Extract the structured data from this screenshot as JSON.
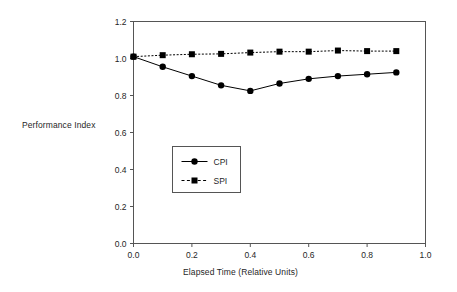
{
  "chart_data": {
    "type": "line",
    "title": "",
    "subtitle": "",
    "xlabel": "Elapsed Time (Relative Units)",
    "ylabel": "Performance Index",
    "xlim": [
      0.0,
      1.0
    ],
    "ylim": [
      0.0,
      1.2
    ],
    "xticks": [
      "0.0",
      "0.2",
      "0.4",
      "0.6",
      "0.8",
      "1.0"
    ],
    "xtick_values": [
      0.0,
      0.2,
      0.4,
      0.6,
      0.8,
      1.0
    ],
    "yticks": [
      "0.0",
      "0.2",
      "0.4",
      "0.6",
      "0.8",
      "1.0",
      "1.2"
    ],
    "ytick_values": [
      0.0,
      0.2,
      0.4,
      0.6,
      0.8,
      1.0,
      1.2
    ],
    "grid": false,
    "legend_position": "center-left-inside",
    "x": [
      0.0,
      0.1,
      0.2,
      0.3,
      0.4,
      0.5,
      0.6,
      0.7,
      0.8,
      0.9
    ],
    "series": [
      {
        "name": "CPI",
        "marker": "circle",
        "linestyle": "solid",
        "color": "#000000",
        "values": [
          1.01,
          0.955,
          0.905,
          0.855,
          0.825,
          0.865,
          0.89,
          0.905,
          0.915,
          0.925
        ]
      },
      {
        "name": "SPI",
        "marker": "square",
        "linestyle": "dashed",
        "color": "#000000",
        "values": [
          1.01,
          1.018,
          1.023,
          1.025,
          1.032,
          1.037,
          1.037,
          1.043,
          1.04,
          1.04
        ]
      }
    ]
  },
  "legend": {
    "entries": [
      {
        "label": "CPI"
      },
      {
        "label": "SPI"
      }
    ]
  },
  "colors": {
    "ink": "#000000",
    "axis": "#555555",
    "background": "#ffffff"
  }
}
